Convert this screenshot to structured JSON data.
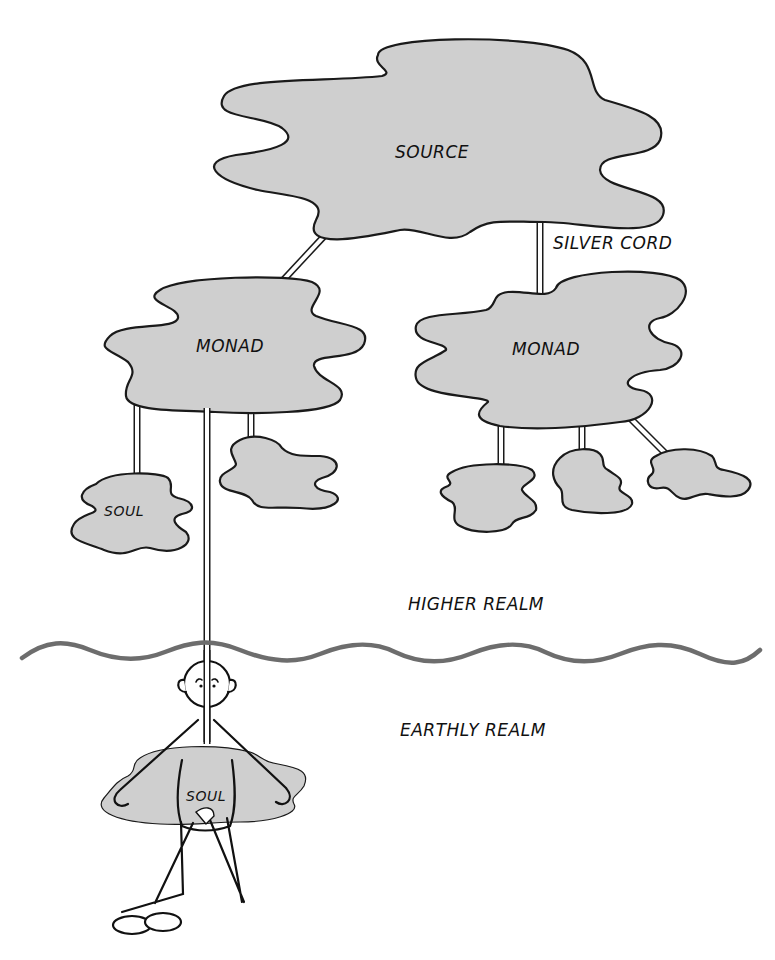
{
  "diagram": {
    "nodes": {
      "source": {
        "label": "SOURCE"
      },
      "monad_left": {
        "label": "MONAD"
      },
      "monad_right": {
        "label": "MONAD"
      },
      "soul_left": {
        "label": "SOUL"
      },
      "soul_embodied": {
        "label": "SOUL"
      }
    },
    "connector_label": "SILVER CORD",
    "realms": {
      "higher": "HIGHER REALM",
      "earthly": "EARTHLY REALM"
    },
    "colors": {
      "cloud_fill": "#cfcfcf",
      "outline": "#1a1a1a",
      "divider": "#6d6d6d",
      "background": "#ffffff"
    },
    "edges": [
      {
        "from": "source",
        "to": "monad_left"
      },
      {
        "from": "source",
        "to": "monad_right",
        "label": "SILVER CORD"
      },
      {
        "from": "monad_left",
        "to": "soul_left"
      },
      {
        "from": "monad_left",
        "to": "soul_embodied"
      },
      {
        "from": "monad_left",
        "to": "soul_unlabeled_1"
      },
      {
        "from": "monad_right",
        "to": "soul_unlabeled_2"
      },
      {
        "from": "monad_right",
        "to": "soul_unlabeled_3"
      },
      {
        "from": "monad_right",
        "to": "soul_unlabeled_4"
      }
    ]
  }
}
